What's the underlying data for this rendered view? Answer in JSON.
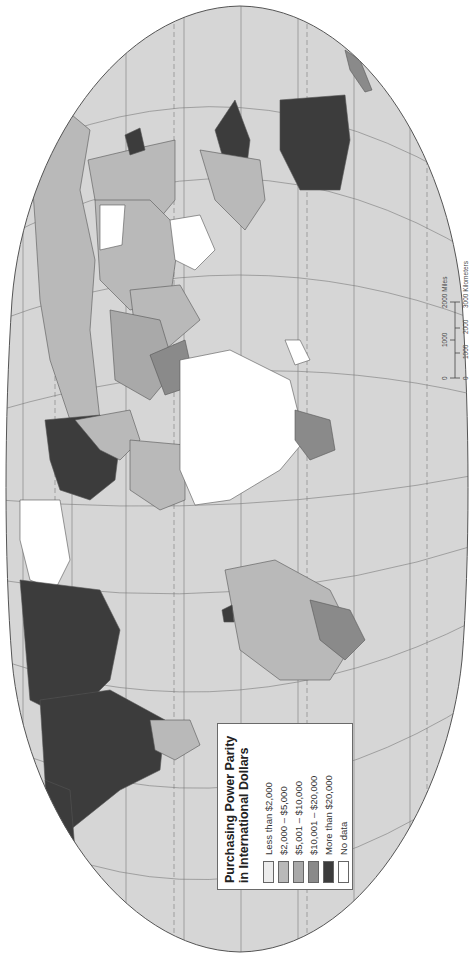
{
  "map": {
    "title": "Purchasing Power Parity in International Dollars",
    "orientation": "rotated 90° counter-clockwise (north at left)",
    "colors": {
      "ocean": "#d6d6d6",
      "outline": "#555555",
      "graticule": "#7a7a7a",
      "less_than_2000": "#ececec",
      "2000_5000": "#b9b9b9",
      "5001_10000": "#a9a9a9",
      "10001_20000": "#8a8a8a",
      "more_than_20000": "#3c3c3c",
      "no_data": "#ffffff"
    }
  },
  "legend": {
    "title_line1": "Purchasing Power Parity",
    "title_line2": "in International Dollars",
    "items": [
      {
        "label": "Less than $2,000",
        "color": "#ececec"
      },
      {
        "label": "$2,000 – $5,000",
        "color": "#b9b9b9"
      },
      {
        "label": "$5,001 – $10,000",
        "color": "#a9a9a9"
      },
      {
        "label": "$10,001 – $20,000",
        "color": "#8a8a8a"
      },
      {
        "label": "More than $20,000",
        "color": "#3c3c3c"
      },
      {
        "label": "No data",
        "color": "#ffffff"
      }
    ]
  },
  "scale_bar": {
    "miles_ticks": [
      "0",
      "1000",
      "2000 Miles"
    ],
    "km_ticks": [
      "0",
      "1000",
      "2000",
      "3000 Kilometers"
    ]
  }
}
